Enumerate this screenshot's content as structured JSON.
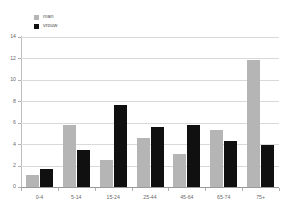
{
  "chart_data": {
    "type": "bar",
    "title": "",
    "xlabel": "",
    "ylabel": "",
    "categories": [
      "0-4",
      "5-14",
      "15-24",
      "25-44",
      "45-64",
      "65-74",
      "75+"
    ],
    "series": [
      {
        "name": "man",
        "color": "#b5b5b5",
        "values": [
          1.15,
          5.8,
          2.5,
          4.6,
          3.05,
          5.35,
          11.85
        ]
      },
      {
        "name": "vrouw",
        "color": "#101010",
        "values": [
          1.65,
          3.5,
          7.7,
          5.6,
          5.75,
          4.3,
          3.9
        ]
      }
    ],
    "ylim": [
      0,
      14
    ],
    "yticks": [
      0,
      2,
      4,
      6,
      8,
      10,
      12,
      14
    ],
    "ytick_labels": [
      "0",
      "2",
      "4",
      "6",
      "8",
      "10",
      "12",
      "14"
    ],
    "grid": true,
    "legend_position": "top-left"
  },
  "legend": {
    "entries": [
      {
        "label": "man"
      },
      {
        "label": "vrouw"
      }
    ]
  },
  "colors": {
    "man": "#b5b5b5",
    "vrouw": "#101010",
    "gridline": "#d9d9d9",
    "axis": "#9a9a9a",
    "text": "#6a6a6a",
    "background": "#ffffff"
  }
}
